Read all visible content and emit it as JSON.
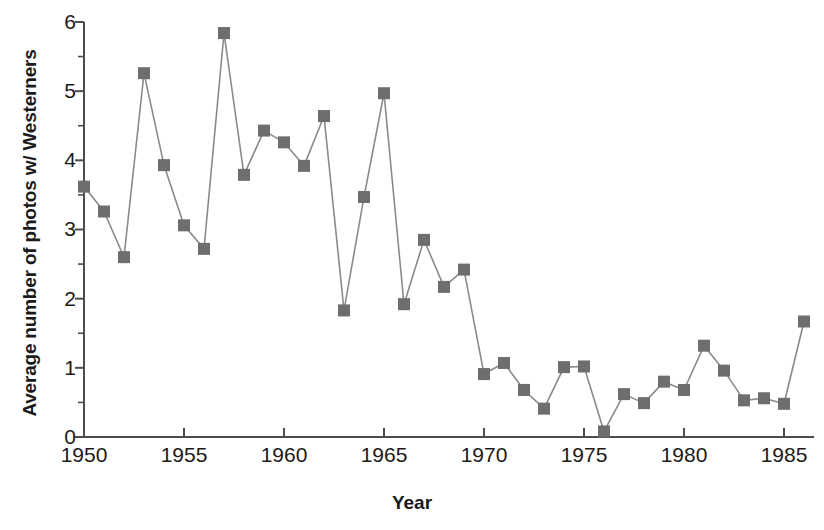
{
  "chart_data": {
    "type": "line",
    "title": "",
    "xlabel": "Year",
    "ylabel": "Average number of photos w/ Westerners",
    "xlim": [
      1950,
      1986.5
    ],
    "ylim": [
      0,
      6
    ],
    "xticks": [
      1950,
      1955,
      1960,
      1965,
      1970,
      1975,
      1980,
      1985
    ],
    "yticks": [
      0,
      1,
      2,
      3,
      4,
      5,
      6
    ],
    "yminorticks": [
      0.5,
      1.5,
      2.5,
      3.5,
      4.5,
      5.5
    ],
    "grid": false,
    "legend": null,
    "marker": "square",
    "marker_color": "#6e6e6e",
    "line_color": "#8a8a8a",
    "axis_color": "#4d4d4d",
    "x": [
      1950,
      1951,
      1952,
      1953,
      1954,
      1955,
      1956,
      1957,
      1958,
      1959,
      1960,
      1961,
      1962,
      1963,
      1964,
      1965,
      1966,
      1967,
      1968,
      1969,
      1970,
      1971,
      1972,
      1973,
      1974,
      1975,
      1976,
      1977,
      1978,
      1979,
      1980,
      1981,
      1982,
      1983,
      1984,
      1985,
      1986
    ],
    "values": [
      3.62,
      3.26,
      2.6,
      5.26,
      3.93,
      3.06,
      2.72,
      5.84,
      3.79,
      4.43,
      4.26,
      3.92,
      4.64,
      1.83,
      3.47,
      4.97,
      1.92,
      2.85,
      2.17,
      2.42,
      0.91,
      1.07,
      0.68,
      0.41,
      1.01,
      1.02,
      0.08,
      0.62,
      0.49,
      0.8,
      0.68,
      1.32,
      0.96,
      0.53,
      0.56,
      0.48,
      1.67
    ]
  },
  "axes": {
    "ytick_labels": [
      "6",
      "5",
      "4",
      "3",
      "2",
      "1",
      "0"
    ],
    "xtick_labels": [
      "1950",
      "1955",
      "1960",
      "1965",
      "1970",
      "1975",
      "1980",
      "1985"
    ]
  }
}
